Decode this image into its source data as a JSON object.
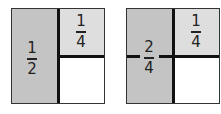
{
  "figures": [
    {
      "name": "half-and-quarter",
      "big_fraction": {
        "num": "1",
        "den": "2"
      },
      "small_fraction": {
        "num": "1",
        "den": "4"
      }
    },
    {
      "name": "two-quarters-and-quarter",
      "big_fraction": {
        "num": "2",
        "den": "4"
      },
      "small_fraction": {
        "num": "1",
        "den": "4"
      }
    }
  ],
  "colors": {
    "shade_dark": "#c4c4c4",
    "shade_light": "#dedede",
    "line": "#111111"
  }
}
